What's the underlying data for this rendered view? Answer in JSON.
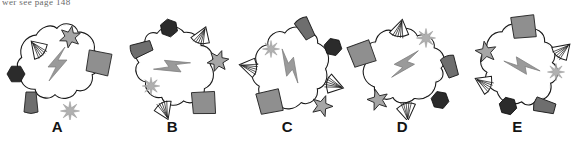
{
  "header": {
    "text": "wer see page 148"
  },
  "figure": {
    "type": "mental-rotation-item",
    "background_color": "#ffffff",
    "panel_count": 5,
    "colors": {
      "outline": "#1a1a1a",
      "blob_fill": "#ffffff",
      "bolt_fill": "#9a9a9a",
      "hexagon_fill": "#2b2b2b",
      "star6_fill": "#a6a6a6",
      "sunburst_fill": "#b0b0b0",
      "quad_fill": "#8f8f8f",
      "wedge_fill": "#6e6e6e",
      "fan_fill": "#ffffff",
      "star5_fill": "#a6a6a6",
      "label_color": "#141414"
    },
    "element_names": [
      "blob-outline",
      "lightning-bolt",
      "dark-hexagon",
      "six-point-star",
      "sunburst",
      "fan-shell",
      "gray-quadrilateral",
      "wedge",
      "five-point-star"
    ],
    "panels": [
      {
        "id": "a",
        "label": "A",
        "rotation_deg": 0,
        "cx": 57,
        "cy": 56,
        "satellites": [
          {
            "name": "dark-hexagon",
            "x": 16,
            "y": 66,
            "r": 0,
            "s": 1.0
          },
          {
            "name": "fan-shell",
            "x": 37,
            "y": 40,
            "r": -40,
            "s": 1.0
          },
          {
            "name": "six-point-star",
            "x": 70,
            "y": 29,
            "r": 10,
            "s": 1.0
          },
          {
            "name": "gray-quadrilateral",
            "x": 99,
            "y": 55,
            "r": 6,
            "s": 1.0
          },
          {
            "name": "sunburst",
            "x": 70,
            "y": 103,
            "r": 0,
            "s": 1.0
          },
          {
            "name": "wedge",
            "x": 31,
            "y": 95,
            "r": 0,
            "s": 1.0
          }
        ]
      },
      {
        "id": "b",
        "label": "B",
        "rotation_deg": 55,
        "cx": 57,
        "cy": 58,
        "satellites": [
          {
            "name": "dark-hexagon",
            "x": 54,
            "y": 20,
            "r": 20,
            "s": 1.0
          },
          {
            "name": "fan-shell",
            "x": 87,
            "y": 27,
            "r": 25,
            "s": 1.0
          },
          {
            "name": "six-point-star",
            "x": 103,
            "y": 53,
            "r": 20,
            "s": 1.0
          },
          {
            "name": "gray-quadrilateral",
            "x": 89,
            "y": 95,
            "r": -8,
            "s": 1.0
          },
          {
            "name": "sunburst",
            "x": 36,
            "y": 78,
            "r": 0,
            "s": 0.92
          },
          {
            "name": "wedge",
            "x": 26,
            "y": 41,
            "r": 70,
            "s": 1.0
          },
          {
            "name": "fan-shell",
            "x": 50,
            "y": 103,
            "r": 160,
            "s": 1.0
          }
        ]
      },
      {
        "id": "c",
        "label": "C",
        "rotation_deg": 130,
        "cx": 60,
        "cy": 58,
        "satellites": [
          {
            "name": "wedge",
            "x": 75,
            "y": 20,
            "r": 150,
            "s": 1.0
          },
          {
            "name": "dark-hexagon",
            "x": 103,
            "y": 39,
            "r": 12,
            "s": 1.0
          },
          {
            "name": "fan-shell",
            "x": 105,
            "y": 77,
            "r": 110,
            "s": 1.0
          },
          {
            "name": "five-point-star",
            "x": 92,
            "y": 98,
            "r": 20,
            "s": 1.0
          },
          {
            "name": "gray-quadrilateral",
            "x": 40,
            "y": 94,
            "r": -18,
            "s": 1.0
          },
          {
            "name": "fan-shell",
            "x": 18,
            "y": 59,
            "r": -75,
            "s": 1.0
          },
          {
            "name": "sunburst",
            "x": 41,
            "y": 41,
            "r": 0,
            "s": 0.9
          }
        ]
      },
      {
        "id": "d",
        "label": "D",
        "rotation_deg": 200,
        "cx": 60,
        "cy": 56,
        "satellites": [
          {
            "name": "fan-shell",
            "x": 55,
            "y": 20,
            "r": 15,
            "s": 1.0
          },
          {
            "name": "sunburst",
            "x": 81,
            "y": 30,
            "r": 0,
            "s": 1.0
          },
          {
            "name": "wedge",
            "x": 105,
            "y": 58,
            "r": 160,
            "s": 1.0
          },
          {
            "name": "dark-hexagon",
            "x": 95,
            "y": 92,
            "r": 10,
            "s": 1.0
          },
          {
            "name": "fan-shell",
            "x": 62,
            "y": 104,
            "r": 175,
            "s": 1.0
          },
          {
            "name": "five-point-star",
            "x": 33,
            "y": 92,
            "r": -15,
            "s": 1.0
          },
          {
            "name": "gray-quadrilateral",
            "x": 17,
            "y": 46,
            "r": -25,
            "s": 1.0
          }
        ]
      },
      {
        "id": "e",
        "label": "E",
        "rotation_deg": 260,
        "cx": 62,
        "cy": 58,
        "satellites": [
          {
            "name": "gray-quadrilateral",
            "x": 64,
            "y": 19,
            "r": -12,
            "s": 1.0
          },
          {
            "name": "fan-shell",
            "x": 103,
            "y": 42,
            "r": 50,
            "s": 1.0
          },
          {
            "name": "sunburst",
            "x": 96,
            "y": 64,
            "r": 0,
            "s": 0.9
          },
          {
            "name": "wedge",
            "x": 84,
            "y": 98,
            "r": 105,
            "s": 1.0
          },
          {
            "name": "dark-hexagon",
            "x": 48,
            "y": 98,
            "r": 14,
            "s": 1.0
          },
          {
            "name": "fan-shell",
            "x": 23,
            "y": 75,
            "r": -60,
            "s": 1.0
          },
          {
            "name": "five-point-star",
            "x": 26,
            "y": 44,
            "r": -10,
            "s": 1.0
          }
        ]
      }
    ]
  }
}
